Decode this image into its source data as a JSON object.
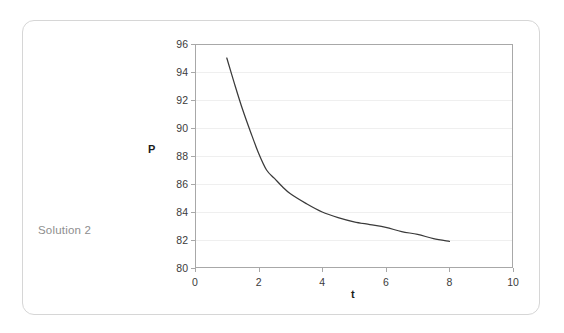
{
  "card": {
    "caption": "Solution 2"
  },
  "chart_data": {
    "type": "line",
    "title": "",
    "xlabel": "t",
    "ylabel": "P",
    "xlim": [
      0,
      10
    ],
    "ylim": [
      80,
      96
    ],
    "xticks": [
      0,
      2,
      4,
      6,
      8,
      10
    ],
    "yticks": [
      80,
      82,
      84,
      86,
      88,
      90,
      92,
      94,
      96
    ],
    "grid": "horizontal",
    "legend": "none",
    "line_color": "#3a3a3a",
    "series": [
      {
        "name": "P",
        "x": [
          1.0,
          1.25,
          1.5,
          1.75,
          2.0,
          2.25,
          2.5,
          2.75,
          3.0,
          3.5,
          4.0,
          4.5,
          5.0,
          5.5,
          6.0,
          6.5,
          7.0,
          7.5,
          8.0
        ],
        "y": [
          95.0,
          93.1,
          91.3,
          89.7,
          88.2,
          87.0,
          86.4,
          85.8,
          85.3,
          84.6,
          84.0,
          83.6,
          83.3,
          83.1,
          82.9,
          82.6,
          82.4,
          82.1,
          81.9
        ]
      }
    ]
  },
  "colors": {
    "card_border": "#d6d6d6",
    "plot_border": "#a8a8a8",
    "gridline": "#efefef",
    "caption_text": "#8e8e8e",
    "tick_text": "#3b3b3b",
    "axis_title": "#1c1c1c"
  }
}
